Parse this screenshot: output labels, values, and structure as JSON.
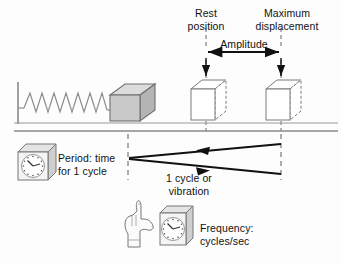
{
  "figure": {
    "background_color": "#fdfdfd",
    "line_color": "#111111",
    "dashed_color": "#777777",
    "block_fill": "#c9c9c9",
    "block_top_fill": "#dcdcdc",
    "block_side_fill": "#b4b4b4"
  },
  "labels": {
    "rest_position": "Rest\nposition",
    "maximum_displacement": "Maximum\ndisplacement",
    "amplitude": "Amplitude",
    "period": "Period: time\nfor 1 cycle",
    "one_cycle": "1 cycle or\nvibration",
    "frequency": "Frequency:\ncycles/sec"
  },
  "elements": {
    "wall": "vertical-wall",
    "floor": "floor-line",
    "spring": {
      "name": "coil-spring",
      "coils": 13
    },
    "solid_block": "solid-block-cube",
    "ghost_block_rest": "outline-block-rest-position",
    "ghost_block_max": "outline-block-maximum-displacement",
    "dashed_line_rest": "dashed-guide-rest-position",
    "dashed_line_max": "dashed-guide-maximum-displacement",
    "amplitude_arrow": "double-headed-amplitude-arrow",
    "arrow_rest_down": "down-arrow-to-rest-block",
    "arrow_max_down": "down-arrow-to-max-block",
    "cycle_arrow_back": "left-pointing-cycle-arrow",
    "cycle_arrow_forward": "right-pointing-cycle-arrow",
    "clock_period": "clock-icon-period",
    "clock_frequency": "clock-icon-frequency",
    "hand": "pointing-hand-icon"
  },
  "geometry": {
    "rest_line_x": 206,
    "max_line_x": 281,
    "floor_y": 131,
    "amplitude_arrow_y": 52,
    "cycle_apex_x": 128,
    "cycle_apex_y": 158
  }
}
